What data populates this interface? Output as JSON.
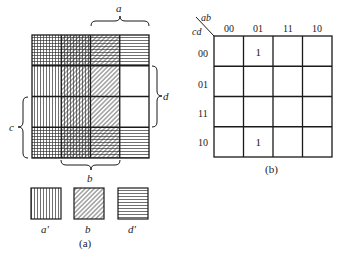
{
  "figure_a": {
    "caption": "(a)",
    "brace_labels": {
      "top": "a",
      "right": "d",
      "left": "c",
      "bottom": "b"
    },
    "legend": [
      {
        "label": "a'",
        "pattern": "vertical-lines"
      },
      {
        "label": "b",
        "pattern": "diagonal-lines"
      },
      {
        "label": "d'",
        "pattern": "horizontal-lines"
      }
    ],
    "grid_rows": 4,
    "grid_cols": 4
  },
  "figure_b": {
    "caption": "(b)",
    "corner_top": "ab",
    "corner_left": "cd",
    "col_headers": [
      "00",
      "01",
      "11",
      "10"
    ],
    "row_headers": [
      "00",
      "01",
      "11",
      "10"
    ],
    "cells": [
      [
        "",
        "1",
        "",
        ""
      ],
      [
        "",
        "",
        "",
        ""
      ],
      [
        "",
        "",
        "",
        ""
      ],
      [
        "",
        "1",
        "",
        ""
      ]
    ]
  },
  "colors": {
    "ink": "#1a1a1a",
    "background": "#ffffff"
  }
}
